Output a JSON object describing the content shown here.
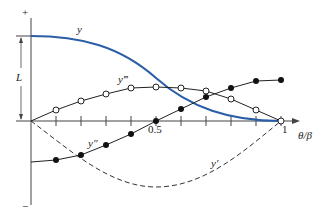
{
  "diagram": {
    "axis": {
      "x_label": "θ/β",
      "x_ticks": [
        "0.5",
        "1"
      ],
      "y_plus": "+",
      "y_minus": "−",
      "dimension_label": "L"
    },
    "curves": [
      {
        "name": "y",
        "label": "y",
        "style": "solid-blue",
        "color": "#2b5ea7"
      },
      {
        "name": "y-prime",
        "label": "y′",
        "style": "dashed",
        "color": "#333333"
      },
      {
        "name": "y-double-prime",
        "label": "y″",
        "style": "solid-filled-dots",
        "color": "#222222"
      },
      {
        "name": "y-triple-prime",
        "label": "y‴",
        "style": "solid-open-dots",
        "color": "#222222"
      }
    ]
  }
}
